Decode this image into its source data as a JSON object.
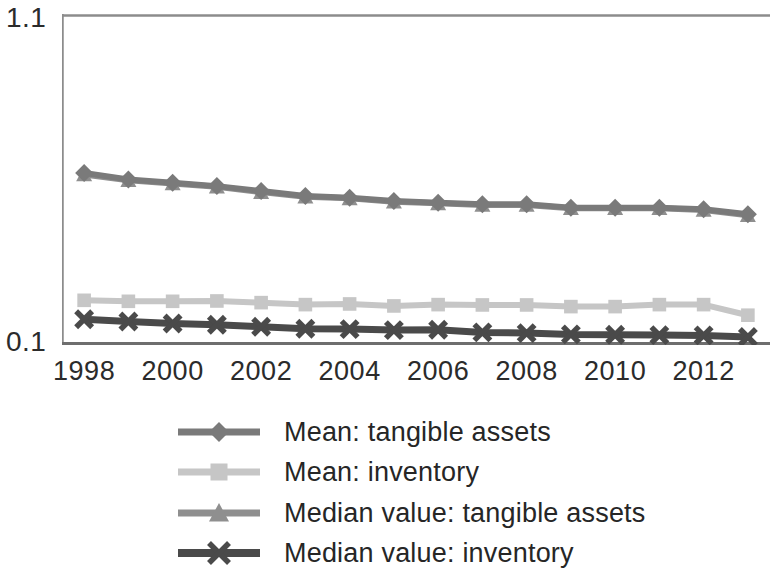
{
  "chart_data": {
    "type": "line",
    "title": "",
    "subtitle": "",
    "xlabel": "",
    "ylabel": "",
    "x": [
      1998,
      1999,
      2000,
      2001,
      2002,
      2003,
      2004,
      2005,
      2006,
      2007,
      2008,
      2009,
      2010,
      2011,
      2012,
      2013
    ],
    "xtick_labels": [
      "1998",
      "2000",
      "2002",
      "2004",
      "2006",
      "2008",
      "2010",
      "2012"
    ],
    "xtick_values": [
      1998,
      2000,
      2002,
      2004,
      2006,
      2008,
      2010,
      2012
    ],
    "xlim": [
      1997.5,
      2013.5
    ],
    "ytick_labels": [
      "1.1",
      "0.1"
    ],
    "ytick_values": [
      1.1,
      0.1
    ],
    "ylim": [
      0.1,
      1.1
    ],
    "grid": false,
    "legend_position": "bottom",
    "series": [
      {
        "name": "Mean: tangible assets",
        "marker": "diamond",
        "color": "#7a7a7a",
        "values": [
          0.62,
          0.6,
          0.59,
          0.58,
          0.565,
          0.55,
          0.545,
          0.535,
          0.53,
          0.525,
          0.525,
          0.515,
          0.515,
          0.515,
          0.51,
          0.495
        ]
      },
      {
        "name": "Mean: inventory",
        "marker": "square",
        "color": "#c6c6c6",
        "values": [
          0.235,
          0.232,
          0.232,
          0.233,
          0.228,
          0.222,
          0.224,
          0.218,
          0.222,
          0.221,
          0.221,
          0.216,
          0.216,
          0.222,
          0.222,
          0.19
        ]
      },
      {
        "name": "Median value: tangible assets",
        "marker": "triangle",
        "color": "#8f8f8f",
        "values": [
          0.615,
          0.598,
          0.588,
          0.578,
          0.562,
          0.548,
          0.543,
          0.533,
          0.528,
          0.523,
          0.523,
          0.513,
          0.513,
          0.513,
          0.508,
          0.492
        ]
      },
      {
        "name": "Median value: inventory",
        "marker": "cross",
        "color": "#4a4a4a",
        "values": [
          0.178,
          0.171,
          0.165,
          0.161,
          0.155,
          0.149,
          0.148,
          0.145,
          0.146,
          0.138,
          0.136,
          0.132,
          0.131,
          0.13,
          0.129,
          0.124
        ]
      }
    ]
  },
  "axis": {
    "y_top_label": "1.1",
    "y_bottom_label": "0.1",
    "axis_color": "#8c8c8c"
  },
  "legend": {
    "items": [
      {
        "label": "Mean: tangible assets",
        "marker": "diamond",
        "color": "#7a7a7a"
      },
      {
        "label": "Mean: inventory",
        "marker": "square",
        "color": "#c6c6c6"
      },
      {
        "label": "Median value: tangible assets",
        "marker": "triangle",
        "color": "#8f8f8f"
      },
      {
        "label": "Median value: inventory",
        "marker": "cross",
        "color": "#4a4a4a"
      }
    ]
  }
}
